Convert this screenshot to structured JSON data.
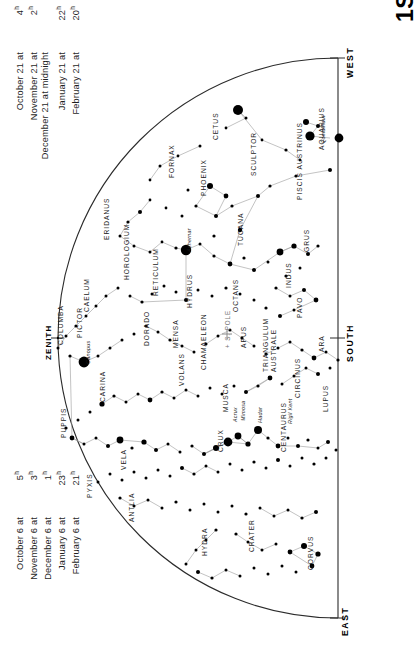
{
  "title": "1S",
  "hemisphere_note": "Southern hemisphere star chart",
  "cardinals": [
    {
      "name": "west",
      "label": "WEST"
    },
    {
      "name": "south",
      "label": "SOUTH"
    },
    {
      "name": "east",
      "label": "EAST"
    }
  ],
  "zenith_label": "ZENITH",
  "pole_label": "+ S. POLE",
  "date_tables": {
    "top": {
      "rows": [
        {
          "label": "October 21 at",
          "time": "4",
          "unit": "h"
        },
        {
          "label": "November 21 at",
          "time": "2",
          "unit": "h"
        },
        {
          "label": "December 21 at midnight",
          "time": "",
          "unit": ""
        },
        {
          "label": "January 21 at",
          "time": "22",
          "unit": "h"
        },
        {
          "label": "February 21 at",
          "time": "20",
          "unit": "h"
        }
      ]
    },
    "bottom": {
      "rows": [
        {
          "label": "October 6 at",
          "time": "5",
          "unit": "h"
        },
        {
          "label": "November 6 at",
          "time": "3",
          "unit": "h"
        },
        {
          "label": "December 6 at",
          "time": "1",
          "unit": "h"
        },
        {
          "label": "January 6 at",
          "time": "23",
          "unit": "h"
        },
        {
          "label": "February 6 at",
          "time": "21",
          "unit": "h"
        }
      ]
    }
  },
  "constellations": [
    {
      "label": "CETUS",
      "x": 212,
      "y": 140,
      "rot": -90
    },
    {
      "label": "AQUARIUS",
      "x": 318,
      "y": 150,
      "rot": -90
    },
    {
      "label": "FORNAX",
      "x": 168,
      "y": 178,
      "rot": -90
    },
    {
      "label": "SCULPTOR",
      "x": 250,
      "y": 176,
      "rot": -90
    },
    {
      "label": "PHOENIX",
      "x": 200,
      "y": 196,
      "rot": -90
    },
    {
      "label": "PISCIS AUSTRINUS",
      "x": 296,
      "y": 200,
      "rot": -90
    },
    {
      "label": "ERIDANUS",
      "x": 103,
      "y": 240,
      "rot": -90
    },
    {
      "label": "TUCANA",
      "x": 237,
      "y": 246,
      "rot": -90
    },
    {
      "label": "GRUS",
      "x": 303,
      "y": 252,
      "rot": -90
    },
    {
      "label": "HOROLOGIUM",
      "x": 123,
      "y": 280,
      "rot": -90
    },
    {
      "label": "RETICULUM",
      "x": 152,
      "y": 296,
      "rot": -90
    },
    {
      "label": "INDUS",
      "x": 285,
      "y": 288,
      "rot": -90
    },
    {
      "label": "CAELUM",
      "x": 83,
      "y": 312,
      "rot": -90
    },
    {
      "label": "HYDRUS",
      "x": 186,
      "y": 308,
      "rot": -90
    },
    {
      "label": "OCTANS",
      "x": 232,
      "y": 312,
      "rot": -90
    },
    {
      "label": "PAVO",
      "x": 296,
      "y": 318,
      "rot": -90
    },
    {
      "label": "COLUMBA",
      "x": 57,
      "y": 345,
      "rot": -90
    },
    {
      "label": "PICTOR",
      "x": 76,
      "y": 338,
      "rot": -90
    },
    {
      "label": "DORADO",
      "x": 143,
      "y": 346,
      "rot": -90
    },
    {
      "label": "MENSA",
      "x": 172,
      "y": 348,
      "rot": -90
    },
    {
      "label": "CHAMAELEON",
      "x": 200,
      "y": 370,
      "rot": -90
    },
    {
      "label": "APUS",
      "x": 240,
      "y": 348,
      "rot": -90
    },
    {
      "label": "ARA",
      "x": 318,
      "y": 352,
      "rot": -90
    },
    {
      "label": "TRIANGULUM",
      "x": 262,
      "y": 372,
      "rot": -90
    },
    {
      "label": "AUSTRALE",
      "x": 270,
      "y": 372,
      "rot": -90
    },
    {
      "label": "VOLANS",
      "x": 178,
      "y": 386,
      "rot": -90
    },
    {
      "label": "CARINA",
      "x": 99,
      "y": 402,
      "rot": -90
    },
    {
      "label": "CIRCINUS",
      "x": 294,
      "y": 398,
      "rot": -90
    },
    {
      "label": "MUSCA",
      "x": 222,
      "y": 412,
      "rot": -90
    },
    {
      "label": "LUPUS",
      "x": 322,
      "y": 412,
      "rot": -90
    },
    {
      "label": "PUPPIS",
      "x": 60,
      "y": 438,
      "rot": -90
    },
    {
      "label": "CRUX",
      "x": 217,
      "y": 452,
      "rot": -90
    },
    {
      "label": "CENTAURUS",
      "x": 280,
      "y": 452,
      "rot": -90
    },
    {
      "label": "VELA",
      "x": 120,
      "y": 470,
      "rot": -90
    },
    {
      "label": "PYXIS",
      "x": 86,
      "y": 498,
      "rot": -90
    },
    {
      "label": "ANTLIA",
      "x": 128,
      "y": 522,
      "rot": -90
    },
    {
      "label": "HYDRA",
      "x": 201,
      "y": 556,
      "rot": -90
    },
    {
      "label": "CRATER",
      "x": 248,
      "y": 552,
      "rot": -90
    },
    {
      "label": "CORVUS",
      "x": 307,
      "y": 570,
      "rot": -90
    }
  ],
  "named_stars": [
    {
      "label": "Fomalhaut",
      "x": 320,
      "y": 143,
      "rot": -90
    },
    {
      "label": "Achernar",
      "x": 186,
      "y": 252,
      "rot": -90
    },
    {
      "label": "Canopus",
      "x": 85,
      "y": 364,
      "rot": -90
    },
    {
      "label": "Acrux",
      "x": 232,
      "y": 422,
      "rot": -90
    },
    {
      "label": "Mimosa",
      "x": 240,
      "y": 421,
      "rot": -90
    },
    {
      "label": "Hadar",
      "x": 257,
      "y": 423,
      "rot": -90
    },
    {
      "label": "Rigil Kent",
      "x": 287,
      "y": 424,
      "rot": -90
    }
  ],
  "chart_data": {
    "type": "scatter",
    "title": "1S",
    "xlabel": "",
    "ylabel": "",
    "projection": "half-dome southern sky",
    "horizon_arc": {
      "cx": 338,
      "cy": 338,
      "r": 280
    },
    "magnitude_sizes": [
      {
        "mag": "0",
        "r": 5.2
      },
      {
        "mag": "1",
        "r": 4.2
      },
      {
        "mag": "2",
        "r": 3.3
      },
      {
        "mag": "3",
        "r": 2.4
      },
      {
        "mag": "4",
        "r": 1.7
      },
      {
        "mag": "5",
        "r": 1.1
      }
    ],
    "colors": {
      "star": "#000000",
      "line": "#999999",
      "horizon": "#333333",
      "text": "#1b1b1b"
    },
    "stars": [
      [
        238,
        110,
        5.0
      ],
      [
        306,
        122,
        3.0
      ],
      [
        318,
        126,
        2.0
      ],
      [
        310,
        136,
        4.6
      ],
      [
        246,
        118,
        1.5
      ],
      [
        226,
        128,
        1.4
      ],
      [
        262,
        140,
        1.4
      ],
      [
        286,
        150,
        1.6
      ],
      [
        300,
        160,
        1.4
      ],
      [
        339,
        138,
        4.4
      ],
      [
        330,
        170,
        2.0
      ],
      [
        296,
        176,
        1.6
      ],
      [
        270,
        186,
        1.6
      ],
      [
        258,
        196,
        2.0
      ],
      [
        200,
        146,
        1.5
      ],
      [
        178,
        156,
        1.4
      ],
      [
        160,
        166,
        1.5
      ],
      [
        150,
        180,
        1.4
      ],
      [
        188,
        190,
        1.5
      ],
      [
        210,
        186,
        3.0
      ],
      [
        226,
        196,
        2.4
      ],
      [
        196,
        206,
        1.6
      ],
      [
        216,
        216,
        2.0
      ],
      [
        232,
        206,
        1.6
      ],
      [
        240,
        230,
        2.2
      ],
      [
        214,
        236,
        1.6
      ],
      [
        182,
        216,
        1.5
      ],
      [
        166,
        208,
        1.4
      ],
      [
        150,
        200,
        1.4
      ],
      [
        140,
        212,
        2.0
      ],
      [
        128,
        222,
        1.6
      ],
      [
        120,
        236,
        1.5
      ],
      [
        134,
        246,
        1.5
      ],
      [
        150,
        252,
        1.5
      ],
      [
        162,
        242,
        1.4
      ],
      [
        176,
        248,
        1.6
      ],
      [
        186,
        250,
        5.2
      ],
      [
        200,
        244,
        1.5
      ],
      [
        214,
        256,
        1.6
      ],
      [
        230,
        264,
        2.4
      ],
      [
        244,
        258,
        1.6
      ],
      [
        254,
        270,
        2.0
      ],
      [
        268,
        262,
        1.5
      ],
      [
        280,
        252,
        3.4
      ],
      [
        294,
        246,
        2.6
      ],
      [
        308,
        254,
        2.0
      ],
      [
        318,
        246,
        1.6
      ],
      [
        300,
        268,
        1.5
      ],
      [
        286,
        276,
        1.6
      ],
      [
        276,
        288,
        1.6
      ],
      [
        290,
        296,
        1.5
      ],
      [
        304,
        290,
        2.0
      ],
      [
        316,
        300,
        2.4
      ],
      [
        294,
        310,
        1.5
      ],
      [
        280,
        316,
        2.0
      ],
      [
        266,
        308,
        1.6
      ],
      [
        254,
        300,
        1.5
      ],
      [
        240,
        294,
        1.5
      ],
      [
        226,
        288,
        1.6
      ],
      [
        212,
        296,
        1.5
      ],
      [
        198,
        290,
        1.5
      ],
      [
        186,
        300,
        2.0
      ],
      [
        176,
        292,
        1.5
      ],
      [
        164,
        286,
        1.5
      ],
      [
        152,
        294,
        1.5
      ],
      [
        142,
        302,
        1.6
      ],
      [
        130,
        296,
        1.5
      ],
      [
        118,
        288,
        1.5
      ],
      [
        106,
        296,
        1.5
      ],
      [
        96,
        306,
        1.5
      ],
      [
        86,
        316,
        1.5
      ],
      [
        76,
        326,
        1.6
      ],
      [
        66,
        336,
        1.5
      ],
      [
        58,
        348,
        1.5
      ],
      [
        70,
        356,
        1.6
      ],
      [
        84,
        362,
        5.4
      ],
      [
        98,
        356,
        1.5
      ],
      [
        110,
        348,
        1.5
      ],
      [
        122,
        340,
        1.5
      ],
      [
        134,
        334,
        1.5
      ],
      [
        146,
        326,
        1.5
      ],
      [
        158,
        332,
        1.5
      ],
      [
        170,
        340,
        1.6
      ],
      [
        182,
        346,
        1.5
      ],
      [
        194,
        352,
        1.5
      ],
      [
        206,
        344,
        1.5
      ],
      [
        218,
        336,
        1.5
      ],
      [
        230,
        330,
        1.5
      ],
      [
        242,
        338,
        1.6
      ],
      [
        254,
        346,
        1.5
      ],
      [
        266,
        354,
        1.6
      ],
      [
        278,
        348,
        1.5
      ],
      [
        290,
        342,
        1.5
      ],
      [
        302,
        350,
        1.6
      ],
      [
        314,
        358,
        2.4
      ],
      [
        326,
        352,
        1.5
      ],
      [
        338,
        360,
        1.6
      ],
      [
        330,
        368,
        1.5
      ],
      [
        318,
        374,
        2.0
      ],
      [
        306,
        368,
        1.5
      ],
      [
        294,
        376,
        1.5
      ],
      [
        282,
        384,
        1.5
      ],
      [
        270,
        378,
        2.4
      ],
      [
        258,
        386,
        1.6
      ],
      [
        246,
        392,
        2.0
      ],
      [
        234,
        386,
        1.5
      ],
      [
        222,
        394,
        1.5
      ],
      [
        210,
        388,
        1.5
      ],
      [
        198,
        396,
        1.5
      ],
      [
        186,
        390,
        1.5
      ],
      [
        174,
        398,
        1.5
      ],
      [
        162,
        392,
        1.6
      ],
      [
        150,
        400,
        2.4
      ],
      [
        138,
        394,
        1.5
      ],
      [
        126,
        402,
        1.5
      ],
      [
        114,
        396,
        1.6
      ],
      [
        102,
        404,
        2.6
      ],
      [
        90,
        412,
        1.5
      ],
      [
        78,
        420,
        1.5
      ],
      [
        66,
        428,
        1.6
      ],
      [
        72,
        438,
        2.4
      ],
      [
        84,
        444,
        1.5
      ],
      [
        96,
        438,
        1.5
      ],
      [
        108,
        446,
        2.0
      ],
      [
        120,
        440,
        3.4
      ],
      [
        132,
        448,
        1.6
      ],
      [
        144,
        442,
        2.6
      ],
      [
        156,
        450,
        2.0
      ],
      [
        168,
        444,
        1.5
      ],
      [
        180,
        452,
        1.5
      ],
      [
        192,
        446,
        1.6
      ],
      [
        204,
        454,
        2.0
      ],
      [
        216,
        448,
        3.0
      ],
      [
        228,
        442,
        4.4
      ],
      [
        238,
        436,
        3.4
      ],
      [
        248,
        444,
        2.6
      ],
      [
        258,
        430,
        4.0
      ],
      [
        268,
        438,
        1.6
      ],
      [
        278,
        446,
        2.4
      ],
      [
        288,
        438,
        1.5
      ],
      [
        298,
        446,
        2.0
      ],
      [
        308,
        440,
        1.6
      ],
      [
        318,
        448,
        1.5
      ],
      [
        328,
        442,
        2.0
      ],
      [
        336,
        450,
        1.5
      ],
      [
        326,
        458,
        1.5
      ],
      [
        314,
        464,
        1.6
      ],
      [
        302,
        458,
        1.5
      ],
      [
        290,
        466,
        1.5
      ],
      [
        278,
        460,
        2.0
      ],
      [
        266,
        468,
        1.5
      ],
      [
        254,
        462,
        1.6
      ],
      [
        242,
        470,
        1.5
      ],
      [
        230,
        464,
        1.5
      ],
      [
        218,
        472,
        1.5
      ],
      [
        206,
        466,
        1.5
      ],
      [
        194,
        474,
        1.6
      ],
      [
        182,
        468,
        2.0
      ],
      [
        170,
        476,
        1.5
      ],
      [
        158,
        470,
        1.5
      ],
      [
        146,
        478,
        1.5
      ],
      [
        134,
        472,
        1.5
      ],
      [
        122,
        480,
        1.5
      ],
      [
        110,
        474,
        1.5
      ],
      [
        98,
        482,
        1.5
      ],
      [
        120,
        498,
        1.6
      ],
      [
        134,
        506,
        1.5
      ],
      [
        148,
        500,
        1.5
      ],
      [
        162,
        508,
        1.5
      ],
      [
        176,
        502,
        1.6
      ],
      [
        190,
        510,
        1.5
      ],
      [
        204,
        504,
        1.5
      ],
      [
        218,
        512,
        1.5
      ],
      [
        232,
        506,
        1.5
      ],
      [
        246,
        514,
        1.6
      ],
      [
        260,
        508,
        1.5
      ],
      [
        274,
        516,
        1.5
      ],
      [
        288,
        510,
        1.5
      ],
      [
        302,
        518,
        1.6
      ],
      [
        316,
        512,
        2.0
      ],
      [
        236,
        534,
        1.6
      ],
      [
        248,
        542,
        1.5
      ],
      [
        262,
        550,
        1.5
      ],
      [
        276,
        544,
        1.5
      ],
      [
        290,
        552,
        2.4
      ],
      [
        304,
        546,
        3.0
      ],
      [
        318,
        554,
        2.6
      ],
      [
        312,
        566,
        2.4
      ],
      [
        296,
        572,
        1.5
      ],
      [
        282,
        566,
        1.5
      ],
      [
        268,
        574,
        1.5
      ],
      [
        254,
        568,
        1.5
      ],
      [
        240,
        576,
        1.5
      ],
      [
        226,
        570,
        1.5
      ],
      [
        212,
        578,
        1.6
      ],
      [
        198,
        572,
        2.0
      ],
      [
        186,
        564,
        1.5
      ],
      [
        196,
        550,
        1.5
      ],
      [
        206,
        540,
        1.5
      ],
      [
        216,
        530,
        1.6
      ]
    ]
  }
}
